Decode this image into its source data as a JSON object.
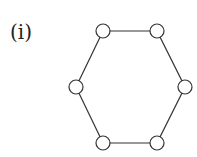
{
  "diagram": {
    "label": "(i)",
    "type": "cycle-graph",
    "node_count": 6,
    "nodes": [
      {
        "id": "n1",
        "x": 103,
        "y": 31
      },
      {
        "id": "n2",
        "x": 157,
        "y": 31
      },
      {
        "id": "n3",
        "x": 185,
        "y": 87
      },
      {
        "id": "n4",
        "x": 157,
        "y": 143
      },
      {
        "id": "n5",
        "x": 103,
        "y": 143
      },
      {
        "id": "n6",
        "x": 76,
        "y": 87
      }
    ],
    "edges": [
      [
        "n1",
        "n2"
      ],
      [
        "n2",
        "n3"
      ],
      [
        "n3",
        "n4"
      ],
      [
        "n4",
        "n5"
      ],
      [
        "n5",
        "n6"
      ],
      [
        "n6",
        "n1"
      ]
    ],
    "node_radius": 7,
    "stroke_color": "#333333",
    "fill_color": "#ffffff"
  }
}
